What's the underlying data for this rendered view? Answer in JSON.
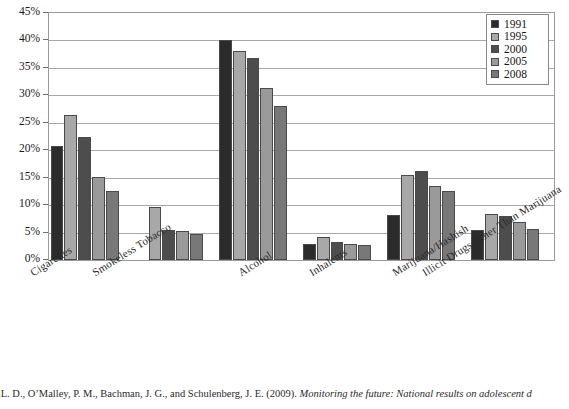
{
  "chart_data": {
    "type": "bar",
    "title": "",
    "xlabel": "",
    "ylabel": "",
    "ylim": [
      0,
      45
    ],
    "ytick_labels": [
      "45%",
      "40%",
      "35%",
      "30%",
      "25%",
      "20%",
      "15%",
      "10%",
      "5%",
      "0%"
    ],
    "ytick_values": [
      45,
      40,
      35,
      30,
      25,
      20,
      15,
      10,
      5,
      0
    ],
    "grid": true,
    "legend_position": "top-right",
    "categories": [
      "Cigarettes",
      "Smokeless Tobacco",
      "Alcohol",
      "Inhalents",
      "Marijuana/Hashish",
      "Illicit Drugs Other Than Marijuana"
    ],
    "series": [
      {
        "name": "1991",
        "color": "#2b2b2b",
        "values": [
          20.8,
          null,
          40.0,
          3.0,
          8.2,
          5.4
        ]
      },
      {
        "name": "1995",
        "color": "#a8a8a8",
        "values": [
          26.5,
          9.7,
          38.0,
          4.2,
          15.5,
          8.4
        ]
      },
      {
        "name": "2000",
        "color": "#4d4d4d",
        "values": [
          22.4,
          5.5,
          36.8,
          3.2,
          16.3,
          8.0
        ]
      },
      {
        "name": "2005",
        "color": "#9a9a9a",
        "values": [
          15.2,
          5.2,
          31.3,
          3.0,
          13.5,
          6.9
        ]
      },
      {
        "name": "2008",
        "color": "#787878",
        "values": [
          12.5,
          4.8,
          28.0,
          2.7,
          12.6,
          5.7
        ]
      }
    ]
  },
  "legend": {
    "items": [
      {
        "label": "1991",
        "color": "#2b2b2b"
      },
      {
        "label": "1995",
        "color": "#a8a8a8"
      },
      {
        "label": "2000",
        "color": "#4d4d4d"
      },
      {
        "label": "2005",
        "color": "#9a9a9a"
      },
      {
        "label": "2008",
        "color": "#787878"
      }
    ]
  },
  "caption": {
    "text_before_italic": "ton, L. D., O’Malley, P. M., Bachman, J. G., and Schulenberg, J. E. (2009). ",
    "text_italic": "Monitoring the future: National results on adolescent d"
  }
}
